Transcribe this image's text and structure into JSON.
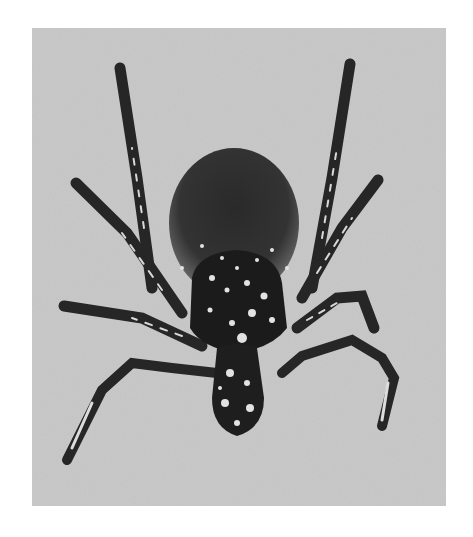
{
  "image": {
    "subject": "tick",
    "description": "Grayscale photograph of a tick viewed from above with eight legs spread, dark round abdomen and speckled scutum and mouthparts, on a light gray background",
    "colors": {
      "page_background": "#ffffff",
      "photo_background": "#c9c9c9",
      "body_dark": "#1e1e1e",
      "abdomen": "#3a3a3a",
      "highlights": "#e6e6e6"
    }
  }
}
